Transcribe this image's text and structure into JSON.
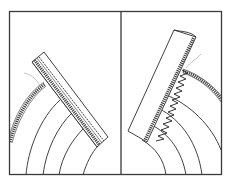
{
  "figure": {
    "panels": [
      {
        "id": "left",
        "stitch": "straight",
        "curve_count": 5
      },
      {
        "id": "right",
        "stitch": "zigzag",
        "curve_count": 4
      }
    ],
    "colors": {
      "line": "#2b2b2b",
      "frame": "#3a3a3a",
      "background": "#ffffff",
      "thread": "#8a8a8a"
    }
  }
}
